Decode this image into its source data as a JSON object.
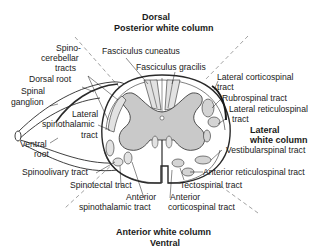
{
  "title": {
    "top_line1": "Dorsal",
    "top_line2": "Posterior white column",
    "bottom_line1": "Anterior white column",
    "bottom_line2": "Ventral",
    "lateral_line1": "Lateral",
    "lateral_line2": "white column"
  },
  "labels": {
    "spinocerebellar_1": "Spino-",
    "spinocerebellar_2": "cerebellar",
    "spinocerebellar_3": "tracts",
    "fasciculus_cuneatus": "Fasciculus cuneatus",
    "fasciculus_gracilis": "Fasciculus gracilis",
    "dorsal_root": "Dorsal root",
    "spinal_ganglion_1": "Spinal",
    "spinal_ganglion_2": "ganglion",
    "lateral_corticospinal_1": "Lateral corticospinal",
    "lateral_corticospinal_2": "tract",
    "rubrospinal": "Rubrospinal tract",
    "lateral_reticulospinal_1": "Lateral reticulospinal",
    "lateral_reticulospinal_2": "tract",
    "lateral_spinothalamic_1": "Lateral",
    "lateral_spinothalamic_2": "spinothalamic",
    "lateral_spinothalamic_3": "tract",
    "ventral_root_1": "Ventral",
    "ventral_root_2": "root",
    "vestibulospinal": "Vestibularspinal tract",
    "spinoolivary": "Spinoolivary tract",
    "anterior_reticulospinal": "Anterior reticulospinal tract",
    "spinotectal": "Spinotectal tract",
    "tectospinal": "Tectospinal tract",
    "anterior_spinothalamic_1": "Anterior",
    "anterior_spinothalamic_2": "spinothalamic tract",
    "anterior_corticospinal_1": "Anterior",
    "anterior_corticospinal_2": "corticospinal tract"
  },
  "colors": {
    "gray_matter": "#c9c9c9",
    "white_matter": "#ffffff",
    "tract_fill": "#d4d4d4",
    "outline": "#2a2a2a",
    "dashed": "#8a8a8a"
  }
}
